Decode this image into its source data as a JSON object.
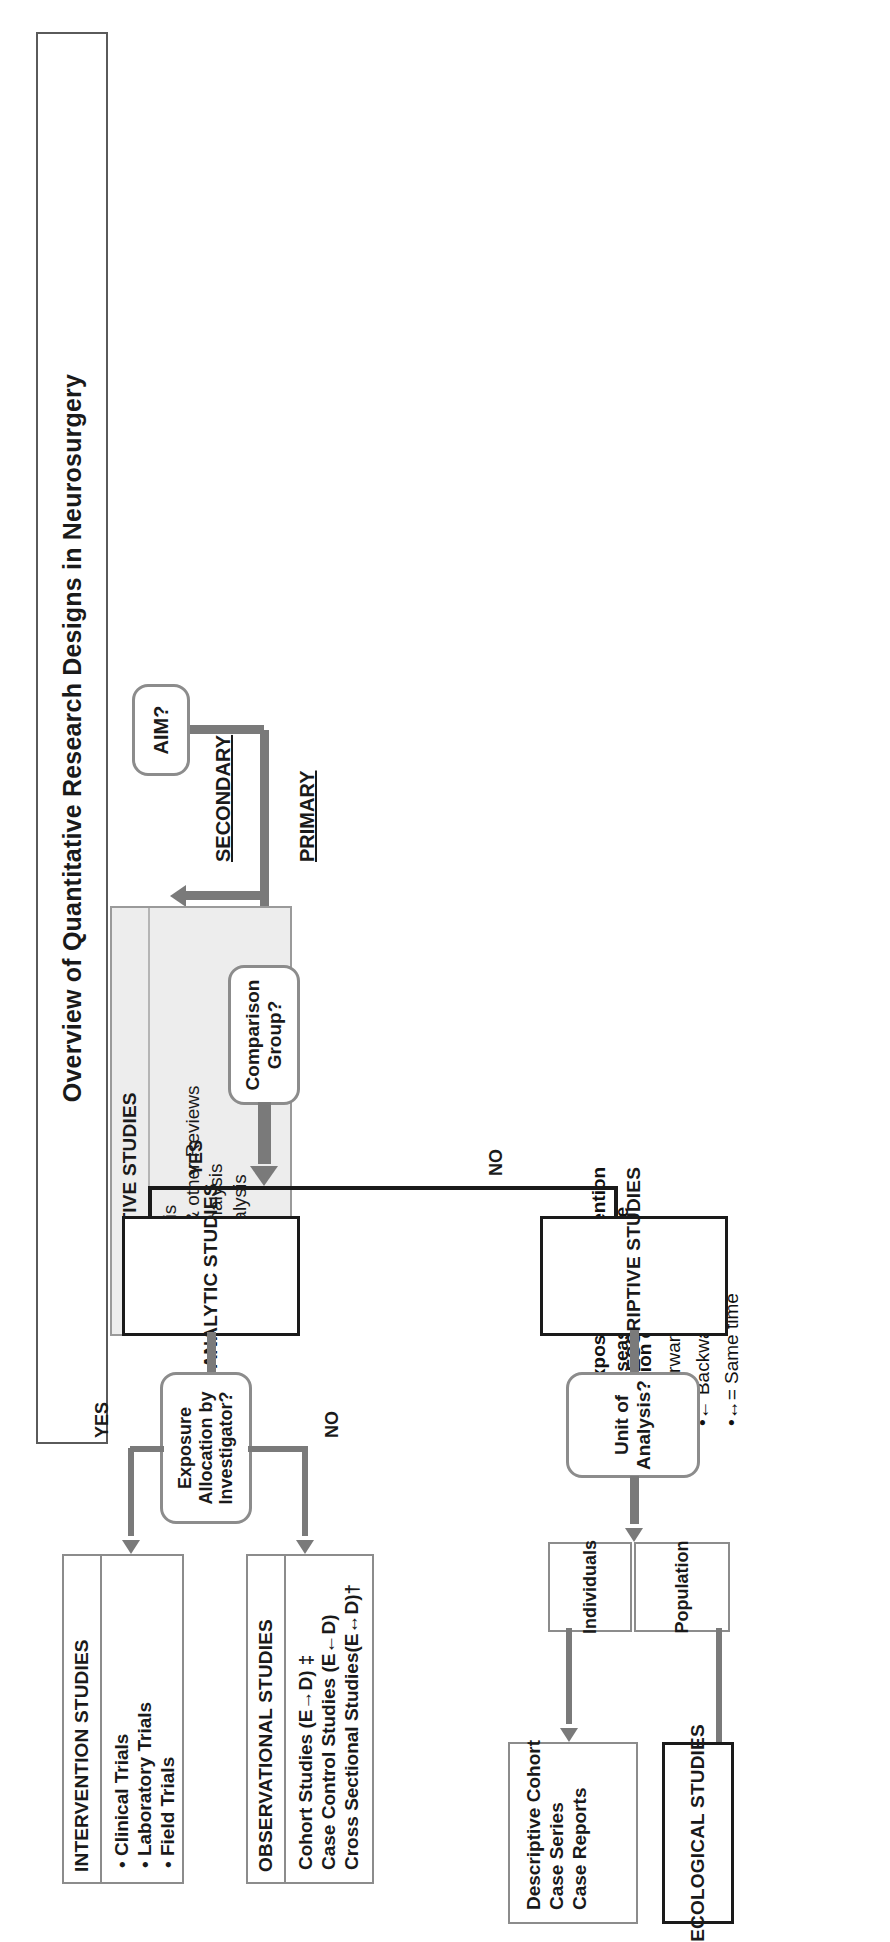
{
  "page": {
    "title": "Overview of Quantitative Research Designs in Neurosurgery"
  },
  "flow": {
    "start": {
      "label": "AIM?"
    },
    "stage_labels": {
      "primary": "PRIMARY",
      "secondary": "SECONDARY"
    },
    "decisions": {
      "comparison_group": "Comparison Group?",
      "exposure_allocation": "Exposure Allocation by Investigator?",
      "unit_of_analysis": "Unit of Analysis?"
    },
    "edge_labels": {
      "comparison_yes": "YES",
      "comparison_no": "NO",
      "allocation_yes": "YES",
      "allocation_no": "NO"
    },
    "branch_labels": {
      "individuals": "Individuals",
      "population": "Population"
    }
  },
  "boxes": {
    "integrative": {
      "heading": "INTERGRATIVE STUDIES",
      "items": [
        "Meta-analysis",
        "Systematic & other Reviews",
        "Economic Analysis",
        "Decision Analysis"
      ]
    },
    "analytic": {
      "heading": "ANALYTIC STUDIES"
    },
    "descriptive": {
      "heading": "DESCRIPTIVE STUDIES"
    },
    "intervention": {
      "heading": "INTERVENTION STUDIES",
      "items": [
        "Clinical Trials",
        "Laboratory Trials",
        "Field Trials"
      ]
    },
    "observational": {
      "heading": "OBSERVATIONAL STUDIES",
      "items": [
        "Cohort Studies (E→D) ‡",
        "Case Control Studies (E←D)",
        "Cross Sectional Studies(E↔D)†"
      ]
    },
    "individual_designs": {
      "items": [
        "Descriptive Cohort",
        "Case Series",
        "Case Reports"
      ]
    },
    "ecological": {
      "heading": "ECOLOGICAL STUDIES"
    }
  },
  "key": {
    "title": "KEY:",
    "lines": [
      "E = Exposure or Intervention",
      "D = Disease or Outcome",
      "Direction of study"
    ],
    "arrows": [
      "•→ Forward",
      "•← Backward",
      "•↔= Same time"
    ]
  }
}
